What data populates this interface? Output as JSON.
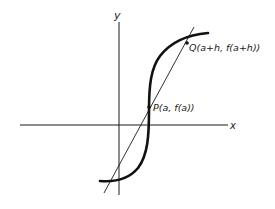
{
  "diagram": {
    "type": "secant-line-on-curve",
    "axes": {
      "x_label": "x",
      "y_label": "y"
    },
    "points": {
      "P": {
        "label": "P(a, f(a))"
      },
      "Q": {
        "label": "Q(a+h, f(a+h))"
      }
    },
    "elements": [
      "x-axis",
      "y-axis",
      "S-shaped curve y=f(x)",
      "secant line through P and Q"
    ],
    "colors": {
      "ink": "#1a1a1a",
      "background": "#ffffff"
    }
  }
}
